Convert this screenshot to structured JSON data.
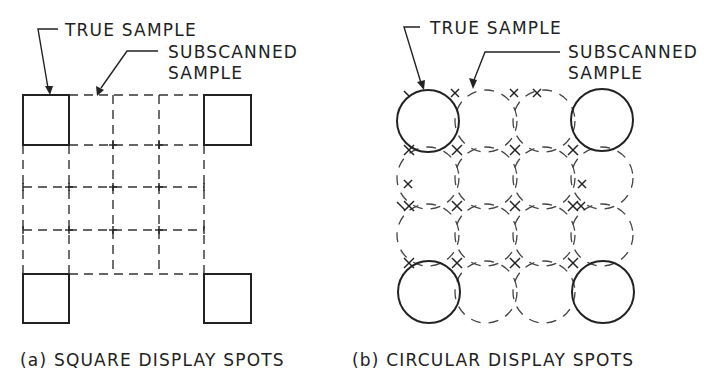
{
  "panel_a": {
    "label_true_sample": "TRUE SAMPLE",
    "label_subscanned_line1": "SUBSCANNED",
    "label_subscanned_line2": "SAMPLE",
    "caption": "(a) SQUARE DISPLAY SPOTS",
    "shape": "square",
    "grid_lines_x": [
      23,
      69,
      113,
      159,
      204
    ],
    "grid_lines_y": [
      95,
      145,
      187,
      230,
      274
    ],
    "true_samples": [
      {
        "x": 23,
        "y": 95,
        "w": 46,
        "h": 50
      },
      {
        "x": 204,
        "y": 95,
        "w": 47,
        "h": 50
      },
      {
        "x": 23,
        "y": 274,
        "w": 46,
        "h": 49
      },
      {
        "x": 204,
        "y": 274,
        "w": 47,
        "h": 49
      }
    ]
  },
  "panel_b": {
    "label_true_sample": "TRUE SAMPLE",
    "label_subscanned_line1": "SUBSCANNED",
    "label_subscanned_line2": "SAMPLE",
    "caption": "(b) CIRCULAR DISPLAY SPOTS",
    "shape": "circle",
    "radius": 31,
    "centers_x": [
      428,
      486,
      544,
      602
    ],
    "centers_y": [
      121,
      178,
      235,
      292
    ],
    "true_sample_positions": [
      [
        0,
        0
      ],
      [
        3,
        0
      ],
      [
        0,
        3
      ],
      [
        3,
        3
      ]
    ]
  },
  "colors": {
    "ink": "#222222",
    "background": "#ffffff"
  }
}
